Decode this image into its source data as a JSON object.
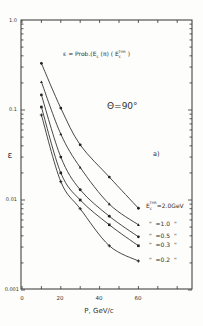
{
  "chart_data": {
    "type": "line",
    "annotation_angle": "Θ=90°",
    "panel_label": "a)",
    "xlabel": "P, GeV/c",
    "ylabel": "ε",
    "xlim": [
      0,
      75
    ],
    "ylim": [
      0.001,
      1.0
    ],
    "yscale": "log",
    "x_ticks": [
      "0",
      "20",
      "40",
      "60"
    ],
    "y_ticks": [
      "1.0",
      "0.1",
      "0.01",
      "0.001"
    ],
    "grid": false,
    "legend_position": "right, inside plot",
    "x": [
      10,
      20,
      30,
      45,
      60
    ],
    "series": [
      {
        "name": "E_c^THR = 2.0 GeV",
        "label": "E_c^THR=2.0GeV",
        "marker": "filled-circle",
        "values": [
          0.33,
          0.105,
          0.041,
          0.018,
          0.0081
        ]
      },
      {
        "name": "E_c^THR = 1.0 GeV",
        "label": "\" =1.0 \"",
        "marker": "triangle",
        "values": [
          0.205,
          0.054,
          0.023,
          0.009,
          0.0053
        ]
      },
      {
        "name": "E_c^THR = 0.5 GeV",
        "label": "\" =0.5 \"",
        "marker": "circle",
        "values": [
          0.147,
          0.03,
          0.013,
          0.0066,
          0.0039
        ]
      },
      {
        "name": "E_c^THR = 0.3 GeV",
        "label": "\" =0.3 \"",
        "marker": "square",
        "values": [
          0.108,
          0.02,
          0.01,
          0.0053,
          0.0031
        ]
      },
      {
        "name": "E_c^THR = 0.2 GeV",
        "label": "\" =0.2 \"",
        "marker": "cross",
        "values": [
          0.088,
          0.016,
          0.008,
          0.0031,
          0.0021
        ]
      }
    ]
  },
  "labels": {
    "title_main": "ε = Prob.(E",
    "title_sub_c": "c",
    "title_mid": " (π) ( E",
    "title_sup": "THR",
    "title_end": " )",
    "angle": "Θ=90°",
    "panel": "a)",
    "xlabel": "P, GeV/c",
    "ylabel": "ε",
    "legend_first_prefix": "E",
    "legend_first_sub": "c",
    "legend_first_sup": "THR",
    "legend_first_value": "=2.0GeV",
    "legend_rest": [
      "\"  =1.0  \"",
      "\"  =0.5  \"",
      "\"  =0.3  \"",
      "\"  =0.2  \""
    ],
    "yticks": [
      "1.0",
      "0.1",
      "0.01",
      "0.001"
    ],
    "xticks": [
      "0",
      "20",
      "40",
      "60"
    ]
  }
}
